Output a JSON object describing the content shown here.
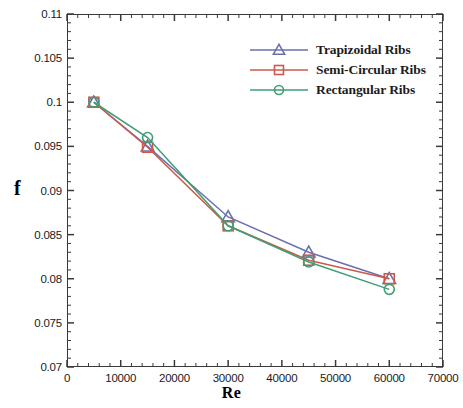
{
  "chart_data": {
    "type": "line",
    "title": "",
    "xlabel": "Re",
    "ylabel": "f",
    "xlim": [
      0,
      70000
    ],
    "ylim": [
      0.07,
      0.11
    ],
    "x_ticks": [
      0,
      10000,
      20000,
      30000,
      40000,
      50000,
      60000,
      70000
    ],
    "x_tick_labels": [
      "0",
      "10000",
      "20000",
      "30000",
      "40000",
      "50000",
      "60000",
      "70000"
    ],
    "y_ticks": [
      0.07,
      0.075,
      0.08,
      0.085,
      0.09,
      0.095,
      0.1,
      0.105,
      0.11
    ],
    "y_tick_labels": [
      "0.07",
      "0.075",
      "0.08",
      "0.085",
      "0.09",
      "0.095",
      "0.1",
      "0.105",
      "0.11"
    ],
    "x_minor_per_major": 5,
    "y_minor_per_major": 5,
    "grid": false,
    "legend_position": "upper-right-inside",
    "x": [
      5000,
      15000,
      30000,
      45000,
      60000
    ],
    "series": [
      {
        "name": "Trapizoidal Ribs",
        "color": "#6b6fae",
        "marker": "triangle",
        "values": [
          0.1,
          0.095,
          0.087,
          0.083,
          0.08
        ]
      },
      {
        "name": "Semi-Circular Ribs",
        "color": "#cc5a4a",
        "marker": "square",
        "values": [
          0.1,
          0.0949,
          0.086,
          0.0821,
          0.08
        ]
      },
      {
        "name": "Rectangular Ribs",
        "color": "#3f9e74",
        "marker": "circle",
        "values": [
          0.1,
          0.096,
          0.086,
          0.0819,
          0.0788
        ]
      }
    ]
  },
  "legend": {
    "items": [
      {
        "label": "Trapizoidal Ribs"
      },
      {
        "label": "Semi-Circular Ribs"
      },
      {
        "label": "Rectangular Ribs"
      }
    ]
  },
  "colors": {
    "axis": "#3a3a3a",
    "text": "#1a1a1a",
    "background": "#ffffff"
  }
}
